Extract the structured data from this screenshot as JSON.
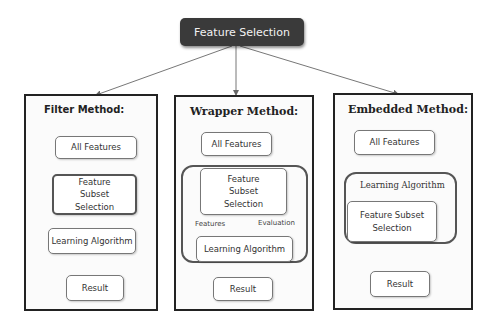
{
  "diagram": {
    "root": {
      "label": "Feature Selection"
    },
    "panels": [
      {
        "id": "filter",
        "title": "Filter Method:",
        "nodes": [
          "All Features",
          "Feature Subset Selection",
          "Learning Algorithm",
          "Result"
        ]
      },
      {
        "id": "wrapper",
        "title": "Wrapper Method:",
        "nodes": [
          "All Features",
          "Feature Subset Selection",
          "Learning Algorithm",
          "Result"
        ],
        "loop_labels": {
          "up": "Features",
          "down": "Evaluation"
        }
      },
      {
        "id": "embedded",
        "title": "Embedded Method:",
        "group_label": "Learning Algorithm",
        "nodes": [
          "All Features",
          "Feature Subset Selection",
          "Result"
        ]
      }
    ],
    "colors": {
      "root_bg": "#3a3a3a",
      "root_text": "#f2f2f2",
      "panel_border": "#222222",
      "node_border": "#777777"
    }
  }
}
